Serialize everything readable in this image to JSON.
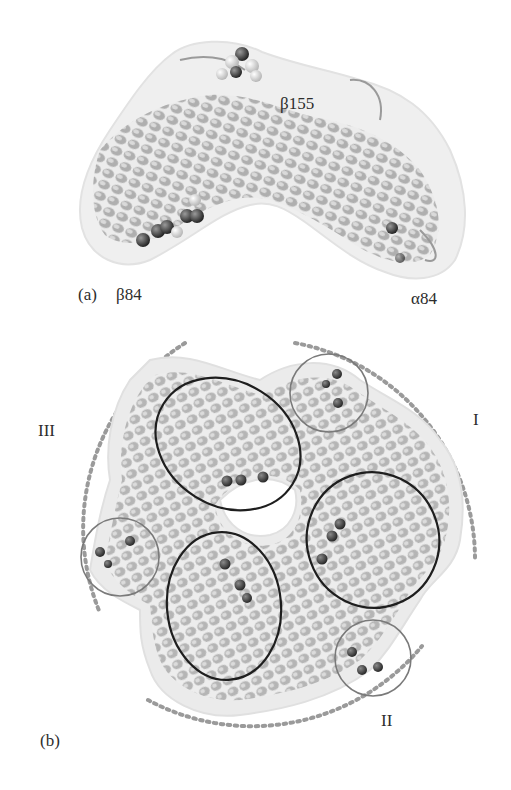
{
  "figure": {
    "panel_a": {
      "label": "(a)",
      "annotations": {
        "top_residue": "β155",
        "left_residue": "β84",
        "right_residue": "α84"
      }
    },
    "panel_b": {
      "label": "(b)",
      "regions": {
        "region_1": "I",
        "region_2": "II",
        "region_3": "III"
      }
    },
    "colors": {
      "ribbon": "#9a9a9a",
      "surface": "#e6e6e6",
      "sphere_dark": "#3c3c3c",
      "ellipse_stroke": "#1e1e1e",
      "circle_stroke": "#7a7a7a",
      "dotted_arc": "#9a9a9a"
    }
  }
}
